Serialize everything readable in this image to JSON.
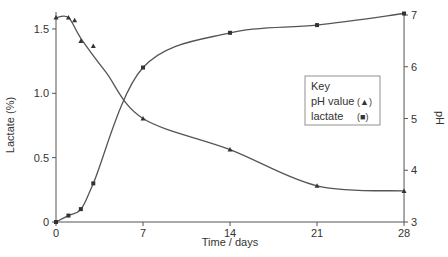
{
  "chart_data": {
    "type": "line",
    "title": "",
    "xlabel": "Time / days",
    "ylabel_left": "Lactate (%)",
    "ylabel_right": "pH",
    "x_ticks": [
      0,
      7,
      14,
      21,
      28
    ],
    "y_left_ticks": [
      "0",
      "0.5",
      "1.0",
      "1.5"
    ],
    "y_right_ticks": [
      "3",
      "4",
      "5",
      "6",
      "7"
    ],
    "xlim": [
      0,
      28
    ],
    "ylim_left": [
      0,
      1.6
    ],
    "ylim_right": [
      3,
      7.1
    ],
    "grid": false,
    "legend": {
      "title": "Key",
      "entries": [
        {
          "label": "pH value",
          "marker": "(▲)"
        },
        {
          "label": "lactate",
          "marker": "(■)"
        }
      ],
      "position": "center-right"
    },
    "series": [
      {
        "name": "pH value",
        "axis": "right",
        "marker": "triangle",
        "x": [
          0,
          1,
          1.5,
          2,
          3,
          7,
          14,
          21,
          28
        ],
        "values": [
          6.95,
          6.95,
          6.9,
          6.5,
          6.4,
          5.0,
          4.4,
          3.7,
          3.6
        ]
      },
      {
        "name": "lactate",
        "axis": "left",
        "marker": "square",
        "x": [
          0,
          1,
          2,
          3,
          7,
          14,
          21,
          28
        ],
        "values": [
          0.0,
          0.05,
          0.1,
          0.3,
          1.2,
          1.47,
          1.53,
          1.62
        ]
      }
    ]
  }
}
